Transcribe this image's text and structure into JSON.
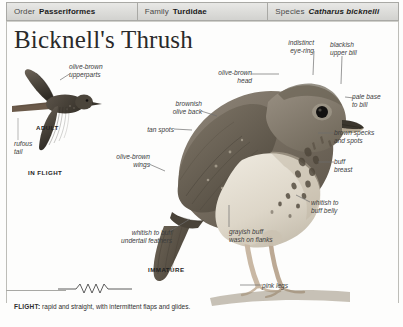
{
  "taxonomy": [
    {
      "rank": "Order",
      "name": "Passeriformes",
      "italic": false
    },
    {
      "rank": "Family",
      "name": "Turdidae",
      "italic": false
    },
    {
      "rank": "Species",
      "name": "Catharus bicknelli",
      "italic": true
    }
  ],
  "title": "Bicknell's Thrush",
  "labels": {
    "olive_brown_upperparts": "olive-brown\nupperparts",
    "adult": "ADULT",
    "rufous_tail": "rufous\ntail",
    "in_flight": "IN FLIGHT",
    "indistinct_eye_ring": "indistinct\neye-ring",
    "blackish_upper_bill": "blackish\nupper bill",
    "pale_base_to_bill": "pale base\nto bill",
    "olive_brown_head": "olive-brown\nhead",
    "brownish_olive_back": "brownish\nolive back",
    "tan_spots": "tan spots",
    "olive_brown_wings": "olive-brown\nwings",
    "brown_specks_and_spots": "brown specks\nand spots",
    "buff_breast": "buff\nbreast",
    "whitish_to_buff_belly": "whitish to\nbuff belly",
    "grayish_buff_wash_on_flanks": "grayish buff\nwash on flanks",
    "whitish_to_buff_undertail": "whitish to buff\nundertail feathers",
    "immature": "IMMATURE",
    "pink_legs": "pink legs"
  },
  "flight_note": {
    "key": "FLIGHT:",
    "text": " rapid and straight, with intermittent flaps and glides."
  },
  "colors": {
    "header_fill": "#dcdcd9",
    "header_border": "#a9a9a5",
    "text": "#2b2b2b",
    "label_text": "#3c3c3c",
    "leader_line": "#6e6e6e",
    "plumage_dark": "#5d564c",
    "plumage_mid": "#8a8177",
    "plumage_light": "#cfc7ba",
    "belly": "#e6e1d6",
    "leg": "#c7b5a2"
  }
}
